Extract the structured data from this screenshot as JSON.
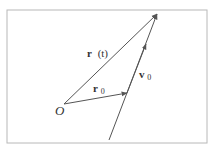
{
  "diagram": {
    "title": "",
    "labels": {
      "origin": "O",
      "position_t": "r",
      "position_t_arg": "(t)",
      "position_0": "r",
      "position_0_sub": "0",
      "velocity_0": "v",
      "velocity_0_sub": "0"
    },
    "colors": {
      "line": "#555555",
      "border": "#b8b8b8",
      "text": "#333333"
    },
    "points": {
      "origin": [
        64,
        104
      ],
      "r0_tip": [
        127,
        93
      ],
      "rt_tip": [
        157,
        14
      ],
      "v_line_start": [
        109,
        140
      ]
    }
  }
}
